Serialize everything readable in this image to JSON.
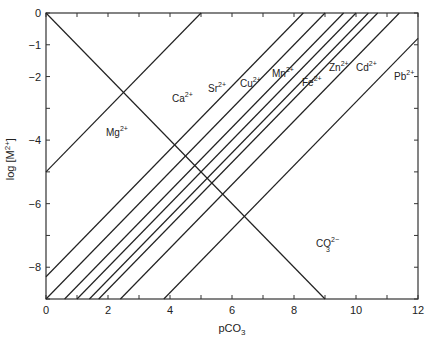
{
  "chart_data": {
    "type": "line",
    "title": "",
    "xlabel": "pCO3",
    "ylabel": "log [M2+]",
    "xlim": [
      0,
      12
    ],
    "ylim": [
      -9,
      0
    ],
    "x_ticks": [
      0,
      2,
      4,
      6,
      8,
      10,
      12
    ],
    "y_ticks": [
      0,
      -1,
      -2,
      -4,
      -6,
      -8
    ],
    "grid": false,
    "legend": "inline labels",
    "series": [
      {
        "name": "Mg2+",
        "label": "Mg",
        "charge": "2+",
        "points": [
          [
            0,
            -5
          ],
          [
            5,
            0
          ]
        ]
      },
      {
        "name": "Ca2+",
        "label": "Ca",
        "charge": "2+",
        "points": [
          [
            0,
            -8.3
          ],
          [
            8.3,
            0
          ]
        ]
      },
      {
        "name": "Sr2+",
        "label": "Sr",
        "charge": "2+",
        "points": [
          [
            0,
            -9
          ],
          [
            9,
            0
          ]
        ]
      },
      {
        "name": "Cu2+",
        "label": "Cu",
        "charge": "2+",
        "points": [
          [
            0.6,
            -9
          ],
          [
            9.6,
            0
          ]
        ]
      },
      {
        "name": "Mn2+",
        "label": "Mn",
        "charge": "2+",
        "points": [
          [
            1.0,
            -9
          ],
          [
            10.0,
            0
          ]
        ]
      },
      {
        "name": "Fe2+",
        "label": "Fe",
        "charge": "2+",
        "points": [
          [
            1.4,
            -9
          ],
          [
            10.4,
            0
          ]
        ]
      },
      {
        "name": "Zn2+",
        "label": "Zn",
        "charge": "2+",
        "points": [
          [
            1.7,
            -9
          ],
          [
            10.7,
            0
          ]
        ]
      },
      {
        "name": "Cd2+",
        "label": "Cd",
        "charge": "2+",
        "points": [
          [
            2.4,
            -9
          ],
          [
            11.4,
            0
          ]
        ]
      },
      {
        "name": "Pb2+",
        "label": "Pb",
        "charge": "2+",
        "points": [
          [
            3.8,
            -9
          ],
          [
            12,
            -0.8
          ]
        ]
      },
      {
        "name": "CO3 2-",
        "label": "CO",
        "sub": "3",
        "charge": "2−",
        "points": [
          [
            0,
            0
          ],
          [
            9,
            -9
          ]
        ]
      }
    ]
  },
  "axes": {
    "x_title": "pCO",
    "x_title_sub": "3",
    "y_title": "log [M",
    "y_title_sup": "2+",
    "y_title_end": "]",
    "x_tick_labels": [
      "0",
      "2",
      "4",
      "6",
      "8",
      "10",
      "12"
    ],
    "y_tick_labels": [
      "0",
      "-1",
      "-2",
      "-4",
      "-6",
      "-8"
    ]
  }
}
